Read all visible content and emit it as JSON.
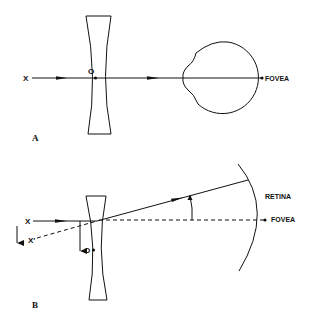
{
  "diagram": {
    "panel_a": {
      "panel_label": "A",
      "object_label": "X",
      "optical_center_label": "O",
      "fovea_label": "FOVEA",
      "elements": [
        "concave lens",
        "optical axis ray",
        "eye globe"
      ]
    },
    "panel_b": {
      "panel_label": "B",
      "object_label": "X",
      "displaced_object_label": "X′",
      "optical_center_label": "O",
      "retina_label": "RETINA",
      "fovea_label": "FOVEA",
      "elements": [
        "decentered concave lens",
        "refracted ray",
        "dashed reference axis",
        "prismatic deviation angle",
        "retina arc"
      ]
    },
    "colors": {
      "ink": "#111111",
      "background": "#ffffff"
    }
  }
}
